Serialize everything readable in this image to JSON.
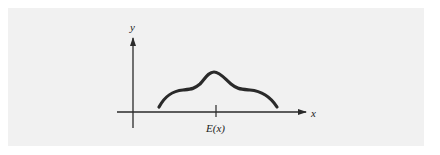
{
  "diagram": {
    "type": "distribution-curve",
    "axes": {
      "x_label": "x",
      "y_label": "y"
    },
    "tick": {
      "label": "E(x)"
    },
    "colors": {
      "background": "#f1f1f1",
      "curve": "#2a2a2a",
      "axis": "#2a2a2a",
      "text": "#222222"
    }
  }
}
